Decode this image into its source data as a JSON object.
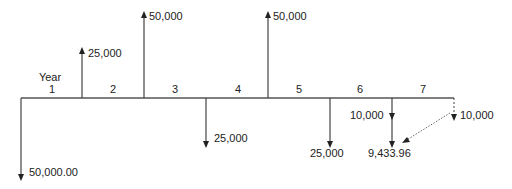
{
  "diagram": {
    "type": "cash-flow-diagram",
    "axis_label": "Year",
    "periods": [
      "1",
      "2",
      "3",
      "4",
      "5",
      "6",
      "7"
    ],
    "cash_flows": [
      {
        "time": 0,
        "direction": "down",
        "label": "50,000.00"
      },
      {
        "time": 1,
        "direction": "up",
        "label": "25,000"
      },
      {
        "time": 2,
        "direction": "up",
        "label": "50,000"
      },
      {
        "time": 3,
        "direction": "down",
        "label": "25,000"
      },
      {
        "time": 4,
        "direction": "up",
        "label": "50,000"
      },
      {
        "time": 5,
        "direction": "down",
        "label": "25,000"
      },
      {
        "time": 6,
        "direction": "down",
        "label": "10,000",
        "combined_label": "9,433.96"
      },
      {
        "time": 7,
        "direction": "down",
        "style": "dashed",
        "label": "10,000",
        "discounted_to": 6
      }
    ]
  }
}
